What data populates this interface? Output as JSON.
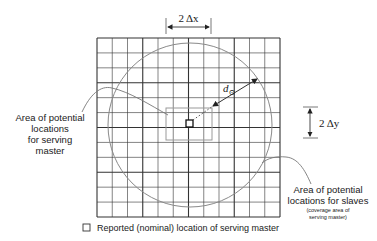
{
  "diagram": {
    "grid": {
      "columns": 12,
      "rows": 12,
      "line_color": "#333333",
      "thick_every": 3
    },
    "dimension_x": {
      "label": "2 Δx"
    },
    "dimension_y": {
      "label": "2 Δy"
    },
    "radius_label": {
      "main": "d",
      "subscript": "⊙"
    },
    "label_left": {
      "lines": [
        "Area of potential",
        "locations",
        "for serving",
        "master"
      ]
    },
    "label_right": {
      "lines": [
        "Area of potential",
        "locations for slaves"
      ],
      "note_lines": [
        "(coverage area of",
        "serving master)"
      ]
    },
    "legend": {
      "icon": "square-marker-icon",
      "text": "Reported (nominal) location of serving master"
    },
    "colors": {
      "grid": "#333333",
      "circle": "#8a8a8a",
      "inner_rect": "#9a9a9a",
      "leader": "#777777",
      "text": "#1a1a1a"
    }
  }
}
